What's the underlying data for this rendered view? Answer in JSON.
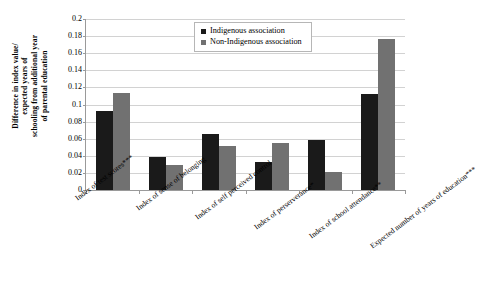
{
  "chart_data": {
    "type": "bar",
    "title": "",
    "subtitle": "",
    "xlabel": "",
    "ylabel": "Difference in index value/ expected years of schooling from additional year of parental education",
    "ylabel_lines": [
      "Difference in index value/",
      "expected years of",
      "schooling from additional year",
      "of parental education"
    ],
    "ylim": [
      0,
      0.2
    ],
    "ytick_labels": [
      "0.2",
      "0.18",
      "0.16",
      "0.14",
      "0.12",
      "0.1",
      "0.08",
      "0.06",
      "0.04",
      "0.02",
      "0"
    ],
    "ytick_values": [
      0.2,
      0.18,
      0.16,
      0.14,
      0.12,
      0.1,
      0.08,
      0.06,
      0.04,
      0.02,
      0
    ],
    "grid": true,
    "grid_axis": "y",
    "legend_position": "top-right",
    "categories": [
      "Index of test scores***",
      "Index of sense of belonging",
      "Index of self perceived control",
      "Index of perserverance*",
      "Index of school attendance**",
      "Expected number of years of education***"
    ],
    "series": [
      {
        "name": "Indigenous association",
        "color": "#1a1a1a",
        "values": [
          0.092,
          0.039,
          0.065,
          0.033,
          0.058,
          0.112
        ]
      },
      {
        "name": "Non-Indigenous association",
        "color": "#717171",
        "values": [
          0.114,
          0.029,
          0.052,
          0.055,
          0.021,
          0.177
        ]
      }
    ]
  },
  "legend": {
    "items": [
      {
        "label": "Indigenous association",
        "swatch": "legend-swatch-black"
      },
      {
        "label": "Non-Indigenous association",
        "swatch": "legend-swatch-gray"
      }
    ]
  },
  "colors": {
    "series_indigenous": "#1a1a1a",
    "series_non_indigenous": "#717171",
    "gridline": "#d2d2d2",
    "axis": "#9a9a9a",
    "background": "#ffffff",
    "text": "#000000"
  }
}
